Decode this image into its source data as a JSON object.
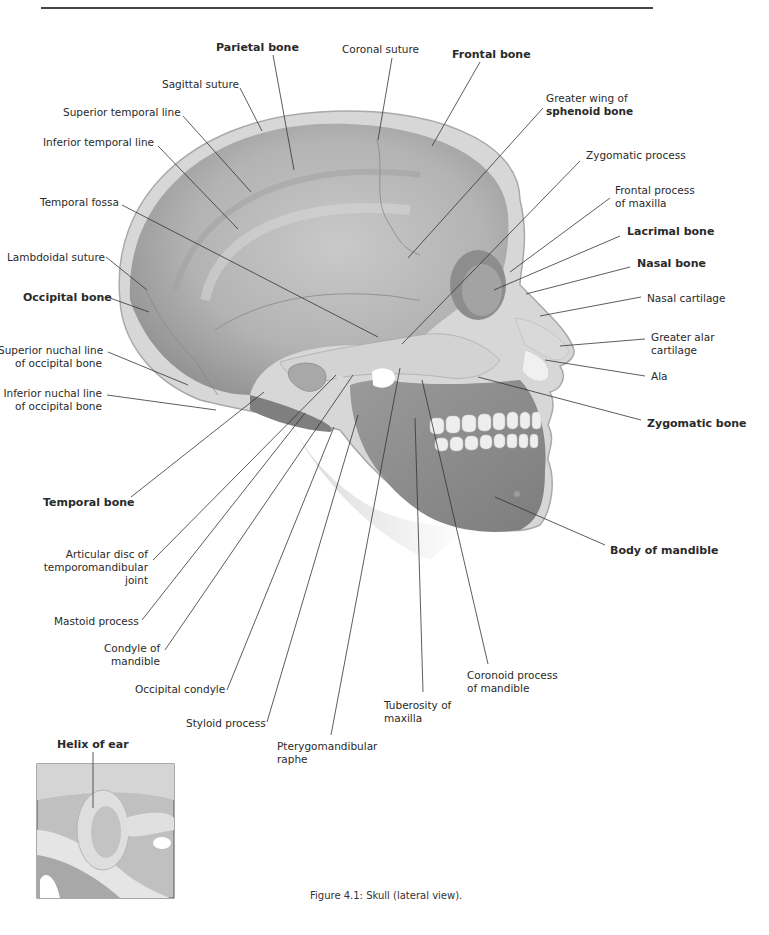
{
  "figure": {
    "caption": "Figure 4.1: Skull (lateral view).",
    "inset_label": "Helix of ear"
  },
  "labels": [
    {
      "id": "parietal-bone",
      "lines": [
        "Parietal bone"
      ],
      "bold": true,
      "x": 216,
      "y": 41,
      "align": "left",
      "lx1": 273,
      "ly1": 55,
      "lx2": 294,
      "ly2": 170
    },
    {
      "id": "coronal-suture",
      "lines": [
        "Coronal suture"
      ],
      "bold": false,
      "x": 342,
      "y": 43,
      "align": "left",
      "lx1": 392,
      "ly1": 58,
      "lx2": 378,
      "ly2": 140
    },
    {
      "id": "frontal-bone",
      "lines": [
        "Frontal bone"
      ],
      "bold": true,
      "x": 452,
      "y": 48,
      "align": "left",
      "lx1": 480,
      "ly1": 62,
      "lx2": 432,
      "ly2": 146
    },
    {
      "id": "sagittal-suture",
      "lines": [
        "Sagittal suture"
      ],
      "bold": false,
      "x": 162,
      "y": 78,
      "align": "left",
      "lx1": 240,
      "ly1": 88,
      "lx2": 262,
      "ly2": 131
    },
    {
      "id": "greater-wing-sphenoid",
      "lines": [
        "Greater wing of",
        "sphenoid bone"
      ],
      "bold": false,
      "bold2": true,
      "x": 546,
      "y": 92,
      "align": "left",
      "lx1": 543,
      "ly1": 108,
      "lx2": 408,
      "ly2": 258
    },
    {
      "id": "superior-temporal-line",
      "lines": [
        "Superior temporal line"
      ],
      "bold": false,
      "x": 63,
      "y": 106,
      "align": "left",
      "lx1": 183,
      "ly1": 116,
      "lx2": 251,
      "ly2": 192
    },
    {
      "id": "inferior-temporal-line",
      "lines": [
        "Inferior temporal line"
      ],
      "bold": false,
      "x": 43,
      "y": 136,
      "align": "left",
      "lx1": 158,
      "ly1": 146,
      "lx2": 238,
      "ly2": 229
    },
    {
      "id": "zygomatic-process",
      "lines": [
        "Zygomatic process"
      ],
      "bold": false,
      "x": 586,
      "y": 149,
      "align": "left",
      "lx1": 580,
      "ly1": 161,
      "lx2": 402,
      "ly2": 344
    },
    {
      "id": "frontal-process-maxilla",
      "lines": [
        "Frontal process",
        "of maxilla"
      ],
      "bold": false,
      "x": 615,
      "y": 184,
      "align": "left",
      "lx1": 610,
      "ly1": 198,
      "lx2": 510,
      "ly2": 272
    },
    {
      "id": "temporal-fossa",
      "lines": [
        "Temporal fossa"
      ],
      "bold": false,
      "x": 40,
      "y": 196,
      "align": "left",
      "lx1": 122,
      "ly1": 205,
      "lx2": 378,
      "ly2": 337
    },
    {
      "id": "lacrimal-bone",
      "lines": [
        "Lacrimal bone"
      ],
      "bold": true,
      "x": 627,
      "y": 225,
      "align": "left",
      "lx1": 620,
      "ly1": 236,
      "lx2": 494,
      "ly2": 290
    },
    {
      "id": "lambdoidal-suture",
      "lines": [
        "Lambdoidal suture"
      ],
      "bold": false,
      "x": 7,
      "y": 251,
      "align": "left",
      "lx1": 106,
      "ly1": 257,
      "lx2": 147,
      "ly2": 290
    },
    {
      "id": "nasal-bone",
      "lines": [
        "Nasal bone"
      ],
      "bold": true,
      "x": 637,
      "y": 257,
      "align": "left",
      "lx1": 630,
      "ly1": 267,
      "lx2": 526,
      "ly2": 294
    },
    {
      "id": "occipital-bone",
      "lines": [
        "Occipital bone"
      ],
      "bold": true,
      "x": 23,
      "y": 291,
      "align": "left",
      "lx1": 110,
      "ly1": 298,
      "lx2": 149,
      "ly2": 312
    },
    {
      "id": "nasal-cartilage",
      "lines": [
        "Nasal cartilage"
      ],
      "bold": false,
      "x": 647,
      "y": 292,
      "align": "left",
      "lx1": 641,
      "ly1": 297,
      "lx2": 540,
      "ly2": 316
    },
    {
      "id": "greater-alar-cartilage",
      "lines": [
        "Greater alar",
        "cartilage"
      ],
      "bold": false,
      "x": 651,
      "y": 331,
      "align": "left",
      "lx1": 645,
      "ly1": 339,
      "lx2": 560,
      "ly2": 346
    },
    {
      "id": "superior-nuchal-line",
      "lines": [
        "Superior nuchal line",
        "of occipital bone"
      ],
      "bold": false,
      "x": -2,
      "y": 344,
      "w": 104,
      "align": "right",
      "lx1": 108,
      "ly1": 352,
      "lx2": 188,
      "ly2": 385
    },
    {
      "id": "ala",
      "lines": [
        "Ala"
      ],
      "bold": false,
      "x": 651,
      "y": 370,
      "align": "left",
      "lx1": 645,
      "ly1": 376,
      "lx2": 545,
      "ly2": 360
    },
    {
      "id": "inferior-nuchal-line",
      "lines": [
        "Inferior nuchal line",
        "of occipital bone"
      ],
      "bold": false,
      "x": 2,
      "y": 387,
      "w": 100,
      "align": "right",
      "lx1": 107,
      "ly1": 395,
      "lx2": 216,
      "ly2": 410
    },
    {
      "id": "zygomatic-bone",
      "lines": [
        "Zygomatic bone"
      ],
      "bold": true,
      "x": 647,
      "y": 417,
      "align": "left",
      "lx1": 641,
      "ly1": 420,
      "lx2": 478,
      "ly2": 377
    },
    {
      "id": "temporal-bone",
      "lines": [
        "Temporal bone"
      ],
      "bold": true,
      "x": 43,
      "y": 496,
      "align": "left",
      "lx1": 131,
      "ly1": 497,
      "lx2": 264,
      "ly2": 392
    },
    {
      "id": "body-of-mandible",
      "lines": [
        "Body of mandible"
      ],
      "bold": true,
      "x": 610,
      "y": 544,
      "align": "left",
      "lx1": 605,
      "ly1": 545,
      "lx2": 495,
      "ly2": 497
    },
    {
      "id": "articular-disc-tmj",
      "lines": [
        "Articular disc of",
        "temporomandibular",
        "joint"
      ],
      "bold": false,
      "x": 40,
      "y": 548,
      "w": 108,
      "align": "right",
      "lx1": 153,
      "ly1": 560,
      "lx2": 336,
      "ly2": 375
    },
    {
      "id": "mastoid-process",
      "lines": [
        "Mastoid process"
      ],
      "bold": false,
      "x": 54,
      "y": 615,
      "align": "left",
      "lx1": 142,
      "ly1": 620,
      "lx2": 305,
      "ly2": 413
    },
    {
      "id": "condyle-of-mandible",
      "lines": [
        "Condyle of",
        "mandible"
      ],
      "bold": false,
      "x": 104,
      "y": 642,
      "w": 56,
      "align": "right",
      "lx1": 165,
      "ly1": 650,
      "lx2": 353,
      "ly2": 375
    },
    {
      "id": "occipital-condyle",
      "lines": [
        "Occipital condyle"
      ],
      "bold": false,
      "x": 135,
      "y": 683,
      "align": "left",
      "lx1": 227,
      "ly1": 690,
      "lx2": 334,
      "ly2": 427
    },
    {
      "id": "coronoid-process",
      "lines": [
        "Coronoid process",
        "of mandible"
      ],
      "bold": false,
      "x": 467,
      "y": 669,
      "align": "left",
      "lx1": 488,
      "ly1": 664,
      "lx2": 422,
      "ly2": 380
    },
    {
      "id": "tuberosity-of-maxilla",
      "lines": [
        "Tuberosity of",
        "maxilla"
      ],
      "bold": false,
      "x": 384,
      "y": 699,
      "align": "left",
      "lx1": 423,
      "ly1": 692,
      "lx2": 415,
      "ly2": 418
    },
    {
      "id": "styloid-process",
      "lines": [
        "Styloid process"
      ],
      "bold": false,
      "x": 186,
      "y": 717,
      "align": "left",
      "lx1": 267,
      "ly1": 722,
      "lx2": 358,
      "ly2": 415
    },
    {
      "id": "pterygomandibular-raphe",
      "lines": [
        "Pterygomandibular",
        "raphe"
      ],
      "bold": false,
      "x": 277,
      "y": 740,
      "align": "left",
      "lx1": 331,
      "ly1": 735,
      "lx2": 400,
      "ly2": 368
    }
  ],
  "colors": {
    "bone_dark": "#8e8e8e",
    "bone_mid": "#b0b0b0",
    "bone_light": "#d4d4d4",
    "skin": "#cfcfcf",
    "skin_edge": "#a8a8a8",
    "leader": "#333333"
  }
}
